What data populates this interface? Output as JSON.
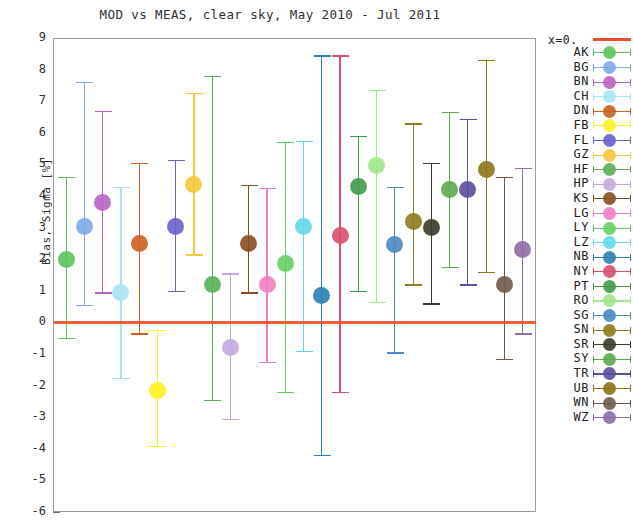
{
  "chart_data": {
    "type": "scatter",
    "title": "MOD vs MEAS, clear sky, May 2010 - Jul 2011",
    "xlabel": "",
    "ylabel": "Bias, Sigma [%]",
    "ylim": [
      -6,
      9
    ],
    "yticks": [
      9,
      8,
      7,
      6,
      5,
      4,
      3,
      2,
      1,
      0,
      -1,
      -2,
      -3,
      -4,
      -5,
      -6
    ],
    "grid": "horizontal dotted",
    "legend_position": "right",
    "legend_header": "x=0.",
    "zero_line_color": "#e8502a",
    "x_axis_ticks_shown": false,
    "note": "Each station plotted as a marker (bias) with vertical error bar (sigma range).",
    "series": [
      {
        "name": "AK",
        "color": "#5cc45c",
        "x": 1,
        "value": 2.0,
        "low": -0.5,
        "high": 4.6
      },
      {
        "name": "BG",
        "color": "#7fa8e8",
        "x": 2,
        "value": 3.05,
        "low": 0.55,
        "high": 7.6
      },
      {
        "name": "BN",
        "color": "#b763c0",
        "x": 3,
        "value": 3.8,
        "low": 0.95,
        "high": 6.7
      },
      {
        "name": "CH",
        "color": "#a9e4f2",
        "x": 4,
        "value": 0.95,
        "low": -1.75,
        "high": 4.3
      },
      {
        "name": "DN",
        "color": "#cc5f22",
        "x": 5,
        "value": 2.5,
        "low": -0.35,
        "high": 5.05
      },
      {
        "name": "FB",
        "color": "#fdf21c",
        "x": 6,
        "value": -2.15,
        "low": -3.9,
        "high": -0.25
      },
      {
        "name": "FL",
        "color": "#6a62c8",
        "x": 7,
        "value": 3.05,
        "low": 1.0,
        "high": 5.15
      },
      {
        "name": "GZ",
        "color": "#f5c83a",
        "x": 8,
        "value": 4.35,
        "low": 2.15,
        "high": 7.25
      },
      {
        "name": "HF",
        "color": "#58ae58",
        "x": 9,
        "value": 1.2,
        "low": -2.45,
        "high": 7.8
      },
      {
        "name": "HP",
        "color": "#c3a8e0",
        "x": 10,
        "value": -0.8,
        "low": -3.05,
        "high": 1.55
      },
      {
        "name": "KS",
        "color": "#8a4b22",
        "x": 11,
        "value": 2.5,
        "low": 0.95,
        "high": 4.35
      },
      {
        "name": "LG",
        "color": "#f07fc0",
        "x": 12,
        "value": 1.2,
        "low": -1.25,
        "high": 4.25
      },
      {
        "name": "LY",
        "color": "#63cf63",
        "x": 13,
        "value": 1.85,
        "low": -2.2,
        "high": 5.7
      },
      {
        "name": "LZ",
        "color": "#63d9e8",
        "x": 14,
        "value": 3.05,
        "low": -0.9,
        "high": 5.75
      },
      {
        "name": "NB",
        "color": "#2a7fb5",
        "x": 15,
        "value": 0.85,
        "low": -4.2,
        "high": 8.45
      },
      {
        "name": "NY",
        "color": "#d94f6e",
        "x": 16,
        "value": 2.75,
        "low": -2.2,
        "high": 8.45
      },
      {
        "name": "PT",
        "color": "#3f9a4a",
        "x": 17,
        "value": 4.3,
        "low": 1.0,
        "high": 5.9
      },
      {
        "name": "RO",
        "color": "#9ee88a",
        "x": 18,
        "value": 4.95,
        "low": 0.65,
        "high": 7.35
      },
      {
        "name": "SG",
        "color": "#4d87c4",
        "x": 19,
        "value": 2.45,
        "low": -0.95,
        "high": 4.3
      },
      {
        "name": "SN",
        "color": "#8c7b1f",
        "x": 20,
        "value": 3.2,
        "low": 1.2,
        "high": 6.3
      },
      {
        "name": "SR",
        "color": "#3b3b2a",
        "x": 21,
        "value": 3.0,
        "low": 0.6,
        "high": 5.05
      },
      {
        "name": "SY",
        "color": "#5ea84f",
        "x": 22,
        "value": 4.2,
        "low": 1.75,
        "high": 6.65
      },
      {
        "name": "TR",
        "color": "#5a4e9e",
        "x": 23,
        "value": 4.2,
        "low": 1.2,
        "high": 6.45
      },
      {
        "name": "UB",
        "color": "#8a7318",
        "x": 24,
        "value": 4.85,
        "low": 1.6,
        "high": 8.3
      },
      {
        "name": "WN",
        "color": "#6e5a4a",
        "x": 25,
        "value": 1.2,
        "low": -1.15,
        "high": 4.6
      },
      {
        "name": "WZ",
        "color": "#8d6ca8",
        "x": 26,
        "value": 2.3,
        "low": -0.35,
        "high": 4.9
      }
    ]
  }
}
